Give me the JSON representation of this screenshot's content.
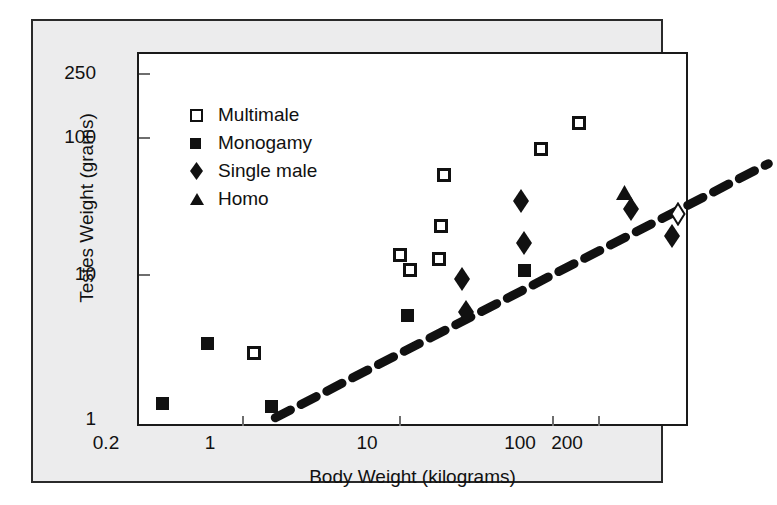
{
  "chart_data": {
    "type": "scatter",
    "title": "",
    "xlabel": "Body Weight (kilograms)",
    "ylabel": "Testes Weight (grams)",
    "xscale": "log",
    "yscale": "log",
    "xlim": [
      0.2,
      200
    ],
    "ylim": [
      1,
      250
    ],
    "xticks": [
      "0.2",
      "1",
      "10",
      "100",
      "200"
    ],
    "xtick_values": [
      0.2,
      1,
      10,
      100,
      200
    ],
    "yticks": [
      "1",
      "10",
      "100",
      "250"
    ],
    "ytick_values": [
      1,
      10,
      100,
      250
    ],
    "grid": false,
    "legend_position": "upper-left-inside",
    "legend": [
      {
        "label": "Multimale",
        "marker": "open-square"
      },
      {
        "label": "Monogamy",
        "marker": "filled-square"
      },
      {
        "label": "Single male",
        "marker": "filled-diamond"
      },
      {
        "label": "Homo",
        "marker": "filled-triangle"
      }
    ],
    "series": [
      {
        "name": "Multimale",
        "marker": "open-square",
        "points": [
          {
            "x": 0.85,
            "y": 2.9
          },
          {
            "x": 5.3,
            "y": 14.0
          },
          {
            "x": 6.0,
            "y": 11.0
          },
          {
            "x": 8.6,
            "y": 13.0
          },
          {
            "x": 8.8,
            "y": 22.0
          },
          {
            "x": 9.2,
            "y": 50.0
          },
          {
            "x": 31.0,
            "y": 75.0
          },
          {
            "x": 50.0,
            "y": 115.0
          }
        ]
      },
      {
        "name": "Monogamy",
        "marker": "filled-square",
        "points": [
          {
            "x": 0.27,
            "y": 1.3
          },
          {
            "x": 0.47,
            "y": 3.4
          },
          {
            "x": 1.05,
            "y": 1.25
          },
          {
            "x": 5.8,
            "y": 5.3
          },
          {
            "x": 25.0,
            "y": 10.8
          }
        ]
      },
      {
        "name": "Single male",
        "marker": "filled-diamond",
        "points": [
          {
            "x": 11.5,
            "y": 9.5
          },
          {
            "x": 12.0,
            "y": 5.6
          },
          {
            "x": 24.0,
            "y": 33.0
          },
          {
            "x": 25.0,
            "y": 17.0
          },
          {
            "x": 95.0,
            "y": 29.0
          },
          {
            "x": 160.0,
            "y": 19.0
          }
        ]
      },
      {
        "name": "Homo",
        "marker": "filled-triangle",
        "points": [
          {
            "x": 88.0,
            "y": 38.0
          }
        ]
      },
      {
        "name": "Unlabeled open diamond",
        "marker": "open-diamond",
        "points": [
          {
            "x": 172.0,
            "y": 27.0
          }
        ]
      }
    ],
    "trendline": {
      "style": "dashed",
      "x_start": 0.3,
      "y_start": 1.7,
      "x_end": 145.0,
      "y_end": 98.0
    }
  }
}
